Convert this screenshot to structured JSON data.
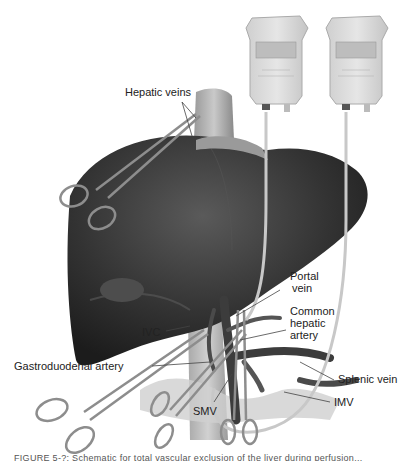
{
  "figure": {
    "type": "medical-illustration",
    "colors": {
      "liver": "#3a3a3a",
      "vessel": "#4a4a4a",
      "bag": "#d9d9d9",
      "tube": "#c8c8c8",
      "background": "#ffffff",
      "label": "#222222"
    }
  },
  "labels": {
    "hepatic_veins": "Hepatic veins",
    "portal_vein_line1": "Portal",
    "portal_vein_line2": "vein",
    "common_hepatic_line1": "Common",
    "common_hepatic_line2": "hepatic",
    "common_hepatic_line3": "artery",
    "ivc": "IVC",
    "gastroduodenal": "Gastroduodenal artery",
    "splenic_vein": "Splenic vein",
    "imv": "IMV",
    "smv": "SMV"
  },
  "caption": {
    "text": "FIGURE 5-?: Schematic for total vascular exclusion of the liver during perfusion..."
  }
}
